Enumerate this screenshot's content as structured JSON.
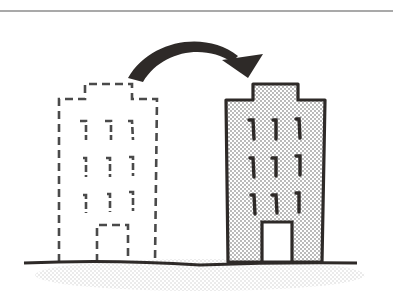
{
  "illustration": {
    "description": "Building relocation illustration: dashed outline building on left, stippled solid building on right, curved arrow from left to right",
    "colors": {
      "ink": "#2e2a28",
      "dashed": "#4a4a4a",
      "stipple": "#bdbdbd",
      "ground_shadow": "#d6d6d6",
      "top_rule": "#555555",
      "background": "#ffffff"
    },
    "source_building": {
      "style": "dashed",
      "floors": 3,
      "windows_per_floor": 3,
      "has_door": true
    },
    "target_building": {
      "style": "stippled-solid",
      "floors": 3,
      "windows_per_floor": 3,
      "has_door": true
    },
    "arrow": {
      "direction": "left-to-right",
      "shape": "curved"
    }
  }
}
